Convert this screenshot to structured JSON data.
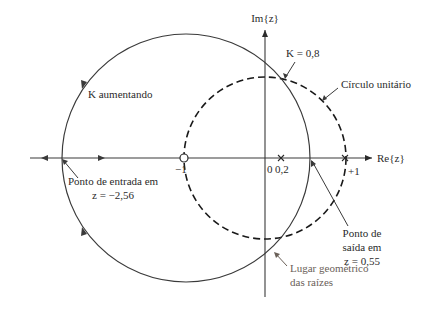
{
  "diagram": {
    "type": "root-locus-z-plane",
    "axes": {
      "real_label": "Re{z}",
      "imag_label": "Im{z}"
    },
    "ticks": {
      "minus_one": "−1",
      "zero": "0",
      "zero_two": "0,2",
      "plus_one": "+1"
    },
    "labels": {
      "k_increasing_k": "K",
      "k_increasing_text": " aumentando",
      "k_value_k": "K",
      "k_value_text": " = 0,8",
      "unit_circle": "Círculo unitário",
      "entry_point_line1": "Ponto de entrada em",
      "entry_point_line2_z": "z",
      "entry_point_line2_val": " = −2,56",
      "exit_point_line1": "Ponto de",
      "exit_point_line2": "saída em",
      "exit_point_line3_z": "z",
      "exit_point_line3_val": " = 0,55",
      "root_locus_line1": "Lugar geométrico",
      "root_locus_line2": "das raízes"
    },
    "elements": {
      "zero_at": -1,
      "poles_at": [
        0.2,
        1
      ],
      "breakin_point": -2.56,
      "breakaway_point": 0.55,
      "unit_circle_radius": 1,
      "k_at_unit_circle": 0.8
    },
    "colors": {
      "line": "#3a3a3a",
      "text": "#2a2a2a",
      "annotation_gray": "#6a6058"
    }
  }
}
